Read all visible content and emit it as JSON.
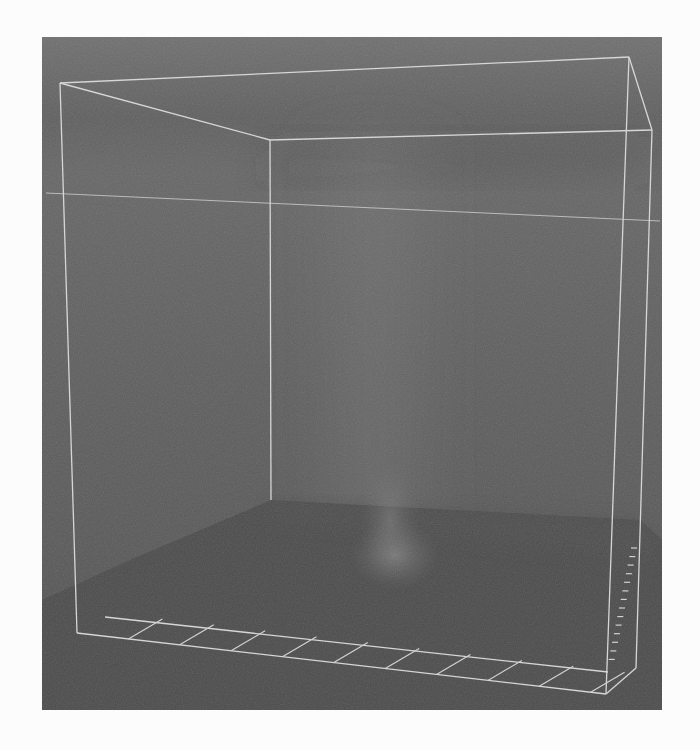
{
  "scene": {
    "description": "3D volume rendering of a faint vertical plume inside a wireframe bounding box",
    "colors": {
      "page_background": "#fcfcfc",
      "panel_top": "#6e6e6e",
      "panel_mid": "#5c5c5c",
      "panel_dark_band": "#555555",
      "floor": "#4a4a4a",
      "floor_far": "#525252",
      "wire": "#d8d8d8",
      "plume": "#8a8a8a"
    },
    "wireframe": {
      "front_top_left": [
        60,
        83
      ],
      "front_top_right": [
        629,
        57
      ],
      "back_top_left": [
        270,
        140
      ],
      "back_top_right": [
        652,
        130
      ],
      "front_bottom_left": [
        77,
        633
      ],
      "front_bottom_right": [
        606,
        694
      ],
      "back_bottom_right": [
        636,
        668
      ],
      "back_vertical_bottom": [
        271,
        500
      ],
      "mid_horizontal_left": [
        46,
        193
      ],
      "mid_horizontal_right": [
        660,
        221
      ]
    },
    "x_axis_ticks": 10,
    "z_axis_ticks": 14
  }
}
